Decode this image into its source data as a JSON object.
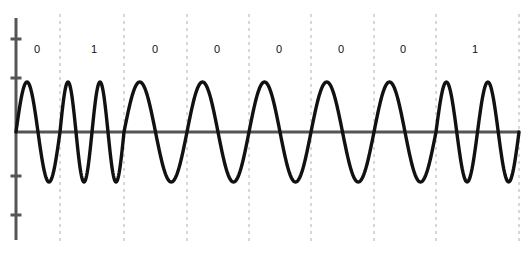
{
  "figure": {
    "name": "bfsk-modulated-waveform",
    "background_color": "#ffffff",
    "width": 529,
    "height": 257
  },
  "axes": {
    "zero_line": {
      "name": "x-axis-zero-line",
      "color": "#555555",
      "y": 132,
      "x_start": 16,
      "x_end": 519
    },
    "y_axis": {
      "name": "y-axis-spine",
      "color": "#555555",
      "x": 16,
      "y_top": 18,
      "y_bottom": 240,
      "tick_positions": [
        39,
        78,
        176,
        215
      ],
      "tick_labels": [
        "",
        "",
        "",
        ""
      ],
      "tick_length": 11
    },
    "gridlines": {
      "name": "bit-boundary-gridlines",
      "color": "#b0b0b0",
      "style": "dashed",
      "x_positions": [
        60,
        124,
        187,
        249,
        311,
        374,
        436,
        519
      ],
      "y_top": 14,
      "y_bottom": 243
    }
  },
  "signal": {
    "name": "bfsk-carrier-trace",
    "color": "#111111",
    "stroke_width": 3.4,
    "amplitude_px": 50,
    "baseline_y": 132,
    "x_start": 16,
    "x_end": 519
  },
  "chart_data": {
    "type": "line",
    "title": "",
    "subtitle": "",
    "xlabel": "",
    "ylabel": "",
    "grid": true,
    "legend_position": "none",
    "modulation": "BFSK",
    "bit_labels": [
      "0",
      "1",
      "0",
      "0",
      "0",
      "0",
      "0",
      "1"
    ],
    "bits": [
      0,
      1,
      0,
      0,
      0,
      0,
      0,
      1
    ],
    "cycles_per_bit": {
      "0": 1,
      "1": 2
    },
    "bit_cell_boundaries_px": [
      16,
      60,
      124,
      187,
      249,
      311,
      374,
      436,
      519
    ],
    "bit_label_x_px": [
      37,
      94,
      155,
      217,
      279,
      341,
      403,
      475
    ],
    "bit_label_y_px": 49,
    "amplitude": 1,
    "ylim": [
      -1.35,
      1.35
    ],
    "xlim": [
      0,
      8
    ],
    "x": [
      0,
      1,
      2,
      3,
      4,
      5,
      6,
      7,
      8
    ],
    "y_description": "sin(2*pi*f*t) with f = 1 cycle per bit for bit 0 and 2 cycles per bit for bit 1",
    "series": [
      {
        "name": "modulated signal",
        "values": [
          0,
          0,
          0,
          0,
          0,
          0,
          0,
          0,
          0
        ]
      }
    ]
  }
}
